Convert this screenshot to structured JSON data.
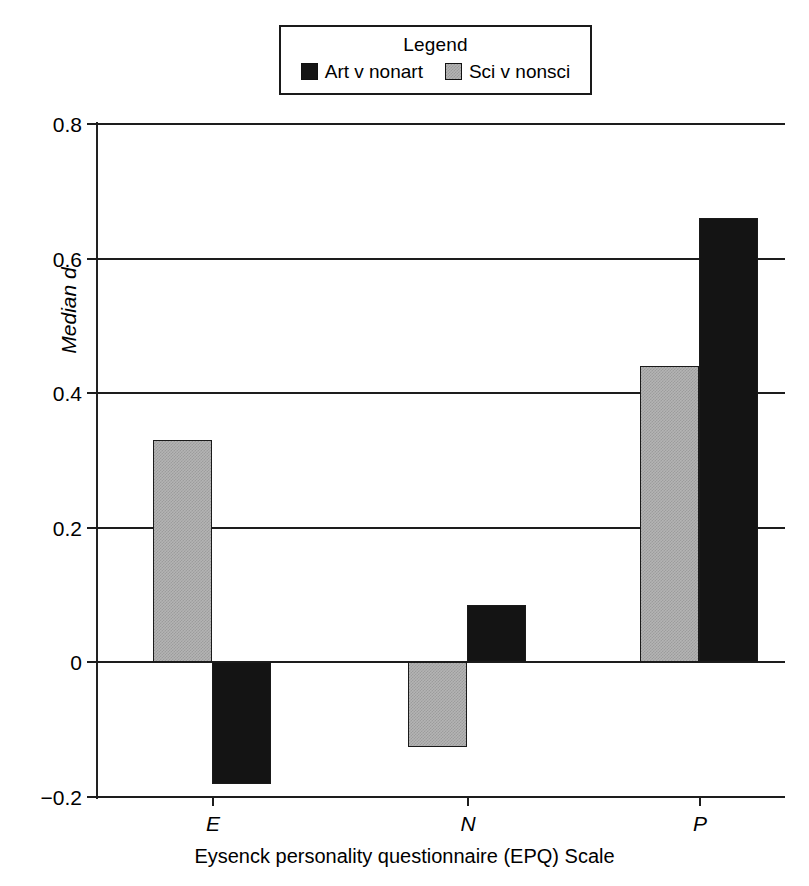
{
  "legend": {
    "title": "Legend",
    "entries": [
      {
        "label": "Art v nonart",
        "color": "#141414",
        "swatch": "black-square-icon"
      },
      {
        "label": "Sci v nonsci",
        "color": "#b4b4b4",
        "swatch": "gray-square-icon"
      }
    ]
  },
  "chart_data": {
    "type": "bar",
    "title": "",
    "subtitle": "",
    "xlabel": "Eysenck personality questionnaire (EPQ) Scale",
    "ylabel": "Median d",
    "categories": [
      "E",
      "N",
      "P"
    ],
    "series": [
      {
        "name": "Art v nonart",
        "color": "#141414",
        "values": [
          -0.18,
          0.085,
          0.66
        ]
      },
      {
        "name": "Sci v nonsci",
        "color": "#b4b4b4",
        "values": [
          0.33,
          -0.125,
          0.44
        ]
      }
    ],
    "series_draw_order": [
      "Sci v nonsci",
      "Art v nonart"
    ],
    "ylim": [
      -0.2,
      0.8
    ],
    "yticks": [
      0.8,
      0.6,
      0.4,
      0.2,
      0,
      -0.2
    ],
    "ytick_labels": [
      "0.8",
      "0.6",
      "0.4",
      "0.2",
      "0",
      "−0.2"
    ],
    "xtick_labels": [
      "E",
      "N",
      "P"
    ],
    "grid": true,
    "grid_axis": "y",
    "legend_position": "top-center",
    "zero_line": 0,
    "bar_style": "adjacent-pairs"
  }
}
